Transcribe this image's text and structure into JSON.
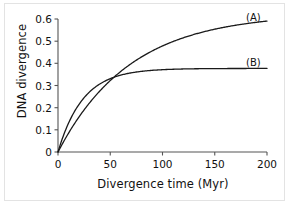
{
  "chart_data": {
    "type": "line",
    "title": "",
    "xlabel": "Divergence time (Myr)",
    "ylabel": "DNA divergence",
    "xlim": [
      0,
      200
    ],
    "ylim": [
      0,
      0.6
    ],
    "xticks": [
      "0",
      "50",
      "100",
      "150",
      "200"
    ],
    "xtick_values": [
      0,
      50,
      100,
      150,
      200
    ],
    "yticks": [
      "0",
      "0.1",
      "0.2",
      "0.3",
      "0.4",
      "0.5",
      "0.6"
    ],
    "ytick_values": [
      0,
      0.1,
      0.2,
      0.3,
      0.4,
      0.5,
      0.6
    ],
    "grid": false,
    "legend_position": "inline-right",
    "annotations": [
      {
        "text": "(A)",
        "x": 196,
        "y": 0.585
      },
      {
        "text": "(B)",
        "x": 196,
        "y": 0.405
      }
    ],
    "series": [
      {
        "name": "(A)",
        "label": "(A)",
        "color": "#1a1a1a",
        "model": "saturating-exponential",
        "plateau": 0.625,
        "rate": 0.0145,
        "x": [
          0,
          10,
          20,
          30,
          40,
          50,
          60,
          70,
          80,
          90,
          100,
          110,
          120,
          130,
          140,
          150,
          160,
          170,
          180,
          190,
          200
        ],
        "values": [
          0,
          0.084,
          0.157,
          0.22,
          0.275,
          0.322,
          0.363,
          0.399,
          0.43,
          0.456,
          0.48,
          0.5,
          0.517,
          0.532,
          0.545,
          0.556,
          0.566,
          0.575,
          0.582,
          0.588,
          0.594
        ]
      },
      {
        "name": "(B)",
        "label": "(B)",
        "color": "#1a1a1a",
        "model": "saturating-exponential",
        "plateau": 0.377,
        "rate": 0.042,
        "x": [
          0,
          10,
          20,
          30,
          40,
          50,
          60,
          70,
          80,
          90,
          100,
          110,
          120,
          130,
          140,
          150,
          160,
          170,
          180,
          190,
          200
        ],
        "values": [
          0,
          0.129,
          0.215,
          0.271,
          0.308,
          0.331,
          0.346,
          0.356,
          0.363,
          0.368,
          0.371,
          0.373,
          0.374,
          0.375,
          0.376,
          0.376,
          0.377,
          0.377,
          0.377,
          0.377,
          0.377
        ]
      }
    ],
    "crossing_point": {
      "x": 70,
      "y": 0.375
    }
  },
  "axes": {
    "y_title": "DNA divergence",
    "x_title": "Divergence time (Myr)"
  }
}
